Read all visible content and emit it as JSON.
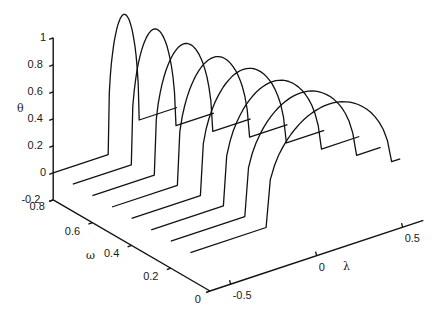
{
  "chart_data": {
    "type": "line",
    "subtype": "3d-waterfall",
    "title": "",
    "xlabel": "λ",
    "ylabel": "ω",
    "zlabel": "θ",
    "xlim": [
      -0.62,
      0.62
    ],
    "ylim": [
      0,
      0.8
    ],
    "zlim": [
      -0.2,
      1
    ],
    "x_ticks": [
      "-0.5",
      "0",
      "0.5"
    ],
    "y_ticks": [
      "0",
      "0.2",
      "0.4",
      "0.6",
      "0.8"
    ],
    "z_ticks": [
      "-0.2",
      "0",
      "0.2",
      "0.4",
      "0.6",
      "0.8",
      "1"
    ],
    "grid": false,
    "legend": null,
    "series": [
      {
        "name": "ω=0.8",
        "omega": 0.8,
        "rise_lambda": -0.3,
        "fall_lambda": -0.12,
        "peak": 1.0,
        "plateau": 0.18
      },
      {
        "name": "ω=0.7",
        "omega": 0.7,
        "rise_lambda": -0.28,
        "fall_lambda": -0.02,
        "peak": 0.95,
        "plateau": 0.18
      },
      {
        "name": "ω=0.6",
        "omega": 0.6,
        "rise_lambda": -0.26,
        "fall_lambda": 0.08,
        "peak": 0.9,
        "plateau": 0.18
      },
      {
        "name": "ω=0.5",
        "omega": 0.5,
        "rise_lambda": -0.24,
        "fall_lambda": 0.18,
        "peak": 0.86,
        "plateau": 0.18
      },
      {
        "name": "ω=0.4",
        "omega": 0.4,
        "rise_lambda": -0.22,
        "fall_lambda": 0.28,
        "peak": 0.83,
        "plateau": 0.18
      },
      {
        "name": "ω=0.3",
        "omega": 0.3,
        "rise_lambda": -0.2,
        "fall_lambda": 0.37,
        "peak": 0.8,
        "plateau": 0.18
      },
      {
        "name": "ω=0.2",
        "omega": 0.2,
        "rise_lambda": -0.19,
        "fall_lambda": 0.46,
        "peak": 0.78,
        "plateau": 0.18
      },
      {
        "name": "ω=0.1",
        "omega": 0.1,
        "rise_lambda": -0.18,
        "fall_lambda": 0.55,
        "peak": 0.76,
        "plateau": 0.18
      }
    ]
  },
  "axes": {
    "theta_label": "θ",
    "omega_label": "ω",
    "lambda_label": "λ"
  }
}
